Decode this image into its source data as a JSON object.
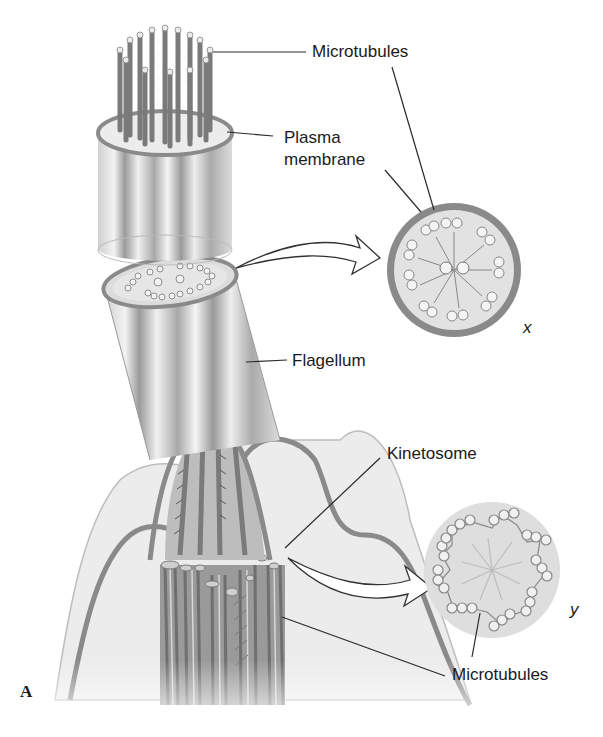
{
  "figure": {
    "panel_letter": "A",
    "labels": {
      "microtubules_top": "Microtubules",
      "plasma_membrane_line1": "Plasma",
      "plasma_membrane_line2": "membrane",
      "flagellum": "Flagellum",
      "kinetosome": "Kinetosome",
      "microtubules_bottom": "Microtubules"
    },
    "cross_sections": {
      "x": {
        "letter": "x",
        "description": "Cross-section of flagellum: 9+2 arrangement of microtubule doublets with central pair"
      },
      "y": {
        "letter": "y",
        "description": "Cross-section of kinetosome: 9 triplets of microtubules, no central pair"
      }
    },
    "colors": {
      "membrane": "#8a8a8a",
      "fill_light": "#e4e4e4",
      "tubule": "#7a7a7a",
      "line": "#2a2a2a"
    }
  }
}
